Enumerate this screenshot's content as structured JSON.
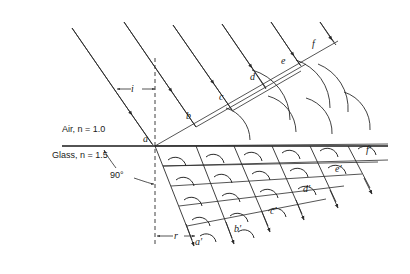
{
  "figure": {
    "type": "huygens-refraction-construction",
    "title_text": "",
    "media": {
      "upper_label": "Air, n = 1.0",
      "upper_index": "1.0",
      "upper_name": "Air",
      "lower_label": "Glass, n = 1.5",
      "lower_index": "1.5",
      "lower_name": "Glass",
      "interface_y": 146,
      "interface_x_start": 62,
      "interface_x_end": 388
    },
    "angles": [
      {
        "name": "angle-of-incidence",
        "label": "i",
        "x": 131,
        "y": 92
      },
      {
        "name": "angle-of-refraction",
        "label": "r",
        "x": 175,
        "y": 238
      },
      {
        "name": "right-angle-wavefront-normal",
        "label": "90°",
        "x": 118,
        "y": 175
      }
    ],
    "normal": {
      "name": "normal-dashed-line",
      "x": 155,
      "y_top": 58,
      "y_bottom": 246
    },
    "incident_wavefront_labels": [
      {
        "label": "a",
        "x": 145,
        "y": 140
      },
      {
        "label": "b",
        "x": 188,
        "y": 117
      },
      {
        "label": "c",
        "x": 221,
        "y": 98
      },
      {
        "label": "d",
        "x": 252,
        "y": 78
      },
      {
        "label": "e",
        "x": 283,
        "y": 62
      },
      {
        "label": "f",
        "x": 314,
        "y": 45
      }
    ],
    "refracted_wavefront_labels": [
      {
        "label": "a′",
        "x": 197,
        "y": 243
      },
      {
        "label": "b′",
        "x": 236,
        "y": 230
      },
      {
        "label": "c′",
        "x": 272,
        "y": 212
      },
      {
        "label": "d′",
        "x": 305,
        "y": 190
      },
      {
        "label": "e′",
        "x": 337,
        "y": 170
      },
      {
        "label": "f′",
        "x": 368,
        "y": 151
      }
    ],
    "colors": {
      "line": "#2a2a2a",
      "interface": "#1a1a1a",
      "text": "#1a1a1a",
      "background": "#ffffff"
    },
    "geometry": {
      "incident_ray_count": 6,
      "refracted_ray_count": 6,
      "incident_wavefront_count": 3,
      "refracted_wavefront_count": 5,
      "wavelet_arc_count": 20,
      "incident_ray_angle_deg": 60,
      "refracted_ray_angle_deg": 35
    }
  }
}
